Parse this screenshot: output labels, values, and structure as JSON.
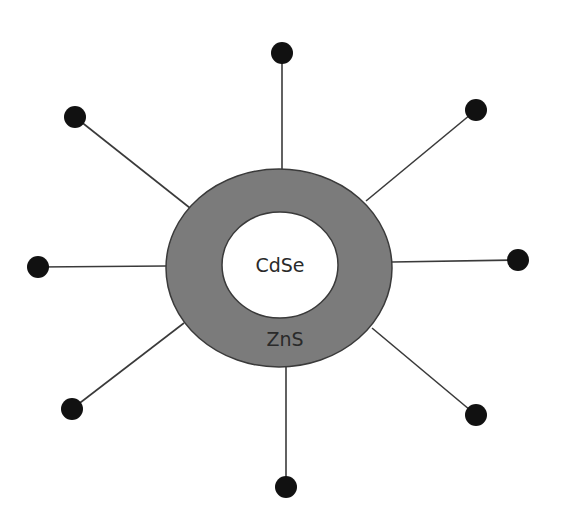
{
  "diagram": {
    "type": "core-shell quantum dot with ligands",
    "colors": {
      "background": "#ffffff",
      "shell_fill": "#7b7b7b",
      "shell_stroke": "#3a3a3a",
      "core_fill": "#ffffff",
      "core_stroke": "#3a3a3a",
      "ligand_line": "#3a3a3a",
      "ligand_head": "#111111",
      "text": "#2a2a2a"
    },
    "shell": {
      "label": "ZnS",
      "cx": 279,
      "cy": 268,
      "rx": 113,
      "ry": 99
    },
    "core": {
      "label": "CdSe",
      "cx": 280,
      "cy": 265,
      "rx": 58,
      "ry": 53
    },
    "ligands": [
      {
        "name": "top",
        "x1": 282,
        "y1": 169,
        "x2": 282,
        "y2": 53
      },
      {
        "name": "top-right",
        "x1": 366,
        "y1": 201,
        "x2": 476,
        "y2": 110
      },
      {
        "name": "right",
        "x1": 392,
        "y1": 262,
        "x2": 518,
        "y2": 260
      },
      {
        "name": "bottom-right",
        "x1": 372,
        "y1": 328,
        "x2": 476,
        "y2": 415
      },
      {
        "name": "bottom",
        "x1": 286,
        "y1": 367,
        "x2": 286,
        "y2": 487
      },
      {
        "name": "bottom-left",
        "x1": 184,
        "y1": 323,
        "x2": 72,
        "y2": 409
      },
      {
        "name": "left",
        "x1": 166,
        "y1": 266,
        "x2": 38,
        "y2": 267
      },
      {
        "name": "top-left",
        "x1": 190,
        "y1": 208,
        "x2": 75,
        "y2": 117
      }
    ],
    "ligand_head_radius": 11
  }
}
